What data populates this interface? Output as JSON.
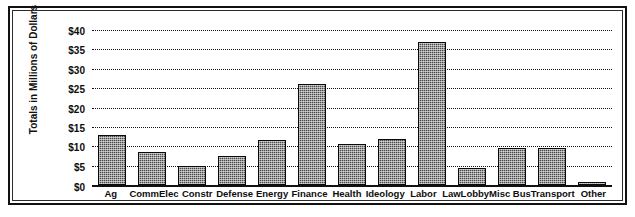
{
  "chart_data": {
    "type": "bar",
    "title": "",
    "xlabel": "",
    "ylabel": "Totals in Millions of Dollars",
    "ylim": [
      0,
      40
    ],
    "ytick_values": [
      40,
      35,
      30,
      25,
      20,
      15,
      10,
      5,
      0
    ],
    "ytick_labels": [
      "$40",
      "$35",
      "$30",
      "$25",
      "$20",
      "$15",
      "$10",
      "$5",
      "$0"
    ],
    "grid": true,
    "legend": "none",
    "categories": [
      "Ag",
      "CommElec",
      "Constr",
      "Defense",
      "Energy",
      "Finance",
      "Health",
      "Ideology",
      "Labor",
      "LawLobby",
      "Misc Bus",
      "Transport",
      "Other"
    ],
    "values": [
      13,
      8.5,
      5,
      7.5,
      11.5,
      26,
      10.5,
      12,
      37,
      4.5,
      9.5,
      9.5,
      0.7
    ],
    "bar_color": "#4a4a4a",
    "bar_edge_color": "#0a0a0a",
    "axis_color": "#111111"
  }
}
